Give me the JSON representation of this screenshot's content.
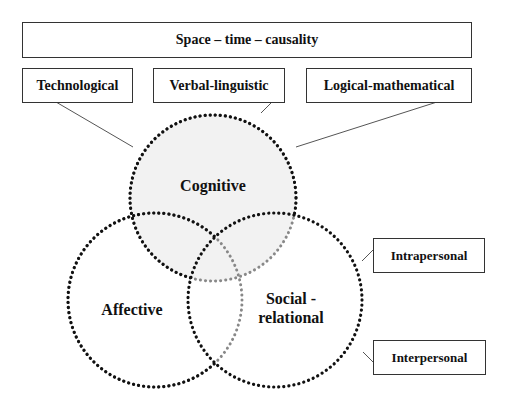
{
  "diagram": {
    "top_box": {
      "label": "Space – time – causality"
    },
    "upper_boxes": [
      {
        "label": "Technological"
      },
      {
        "label": "Verbal-linguistic"
      },
      {
        "label": "Logical-mathematical"
      }
    ],
    "side_boxes": [
      {
        "label": "Intrapersonal"
      },
      {
        "label": "Interpersonal"
      }
    ],
    "circles": [
      {
        "id": "cognitive",
        "label": "Cognitive",
        "fill": "#f2f2f2",
        "cx": 213,
        "cy": 198,
        "r": 83
      },
      {
        "id": "affective",
        "label": "Affective",
        "fill": "none",
        "cx": 155,
        "cy": 300,
        "r": 87
      },
      {
        "id": "social",
        "label_line1": "Social -",
        "label_line2": "relational",
        "fill": "none",
        "cx": 275,
        "cy": 300,
        "r": 87
      }
    ],
    "colors": {
      "stroke_dark": "#111111",
      "stroke_light": "#888888",
      "box_border": "#333333",
      "connector": "#555555"
    }
  }
}
